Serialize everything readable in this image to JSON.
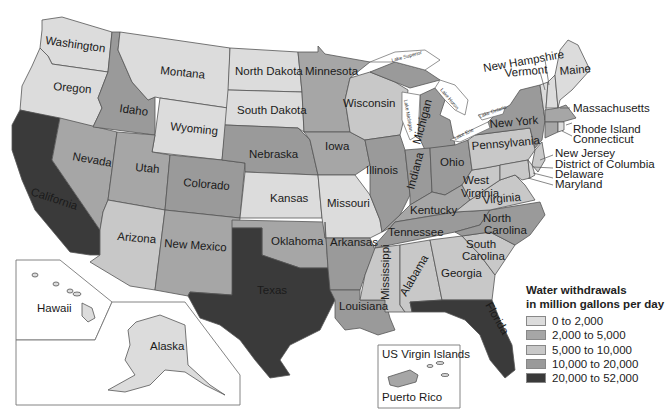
{
  "title": "Water withdrawals in million gallons per day",
  "legend": {
    "title_line1": "Water withdrawals",
    "title_line2": "in million gallons per day",
    "items": [
      {
        "label": "0 to 2,000",
        "color": "#dcdcdc"
      },
      {
        "label": "2,000 to 5,000",
        "color": "#a6a6a6"
      },
      {
        "label": "5,000 to 10,000",
        "color": "#c8c8c8"
      },
      {
        "label": "10,000 to 20,000",
        "color": "#9a9a9a"
      },
      {
        "label": "20,000 to 52,000",
        "color": "#3a3a3a"
      }
    ]
  },
  "states": {
    "washington": {
      "label": "Washington",
      "class": "0 to 2,000"
    },
    "oregon": {
      "label": "Oregon",
      "class": "0 to 2,000"
    },
    "california": {
      "label": "California",
      "class": "20,000 to 52,000"
    },
    "nevada": {
      "label": "Nevada",
      "class": "2,000 to 5,000"
    },
    "idaho": {
      "label": "Idaho",
      "class": "10,000 to 20,000"
    },
    "montana": {
      "label": "Montana",
      "class": "0 to 2,000"
    },
    "wyoming": {
      "label": "Wyoming",
      "class": "0 to 2,000"
    },
    "utah": {
      "label": "Utah",
      "class": "2,000 to 5,000"
    },
    "arizona": {
      "label": "Arizona",
      "class": "5,000 to 10,000"
    },
    "colorado": {
      "label": "Colorado",
      "class": "10,000 to 20,000"
    },
    "new_mexico": {
      "label": "New Mexico",
      "class": "2,000 to 5,000"
    },
    "north_dakota": {
      "label": "North Dakota",
      "class": "0 to 2,000"
    },
    "south_dakota": {
      "label": "South Dakota",
      "class": "0 to 2,000"
    },
    "nebraska": {
      "label": "Nebraska",
      "class": "10,000 to 20,000"
    },
    "kansas": {
      "label": "Kansas",
      "class": "0 to 2,000"
    },
    "oklahoma": {
      "label": "Oklahoma",
      "class": "2,000 to 5,000"
    },
    "texas": {
      "label": "Texas",
      "class": "20,000 to 52,000"
    },
    "minnesota": {
      "label": "Minnesota",
      "class": "2,000 to 5,000"
    },
    "iowa": {
      "label": "Iowa",
      "class": "2,000 to 5,000"
    },
    "missouri": {
      "label": "Missouri",
      "class": "5,000 to 10,000"
    },
    "arkansas": {
      "label": "Arkansas",
      "class": "10,000 to 20,000"
    },
    "louisiana": {
      "label": "Louisiana",
      "class": "10,000 to 20,000"
    },
    "wisconsin": {
      "label": "Wisconsin",
      "class": "5,000 to 10,000"
    },
    "illinois": {
      "label": "Illinois",
      "class": "10,000 to 20,000"
    },
    "michigan": {
      "label": "Michigan",
      "class": "10,000 to 20,000"
    },
    "indiana": {
      "label": "Indiana",
      "class": "10,000 to 20,000"
    },
    "ohio": {
      "label": "Ohio",
      "class": "10,000 to 20,000"
    },
    "kentucky": {
      "label": "Kentucky",
      "class": "2,000 to 5,000"
    },
    "tennessee": {
      "label": "Tennessee",
      "class": "10,000 to 20,000"
    },
    "mississippi": {
      "label": "Mississippi",
      "class": "5,000 to 10,000"
    },
    "alabama": {
      "label": "Alabama",
      "class": "5,000 to 10,000"
    },
    "georgia": {
      "label": "Georgia",
      "class": "5,000 to 10,000"
    },
    "florida": {
      "label": "Florida",
      "class": "20,000 to 52,000"
    },
    "south_carolina": {
      "label": "South Carolina",
      "class": "5,000 to 10,000"
    },
    "north_carolina": {
      "label": "North Carolina",
      "class": "10,000 to 20,000"
    },
    "virginia": {
      "label": "Virginia",
      "class": "5,000 to 10,000"
    },
    "west_virginia": {
      "label": "West Virginia",
      "class": "5,000 to 10,000"
    },
    "pennsylvania": {
      "label": "Pennsylvania",
      "class": "5,000 to 10,000"
    },
    "new_york": {
      "label": "New York",
      "class": "10,000 to 20,000"
    },
    "vermont": {
      "label": "Vermont",
      "class": "0 to 2,000"
    },
    "new_hampshire": {
      "label": "New Hampshire",
      "class": "0 to 2,000"
    },
    "maine": {
      "label": "Maine",
      "class": "0 to 2,000"
    },
    "massachusetts": {
      "label": "Massachusetts",
      "class": "2,000 to 5,000"
    },
    "rhode_island": {
      "label": "Rhode Island",
      "class": "0 to 2,000"
    },
    "connecticut": {
      "label": "Connecticut",
      "class": "2,000 to 5,000"
    },
    "new_jersey": {
      "label": "New Jersey",
      "class": "5,000 to 10,000"
    },
    "delaware": {
      "label": "Delaware",
      "class": "0 to 2,000"
    },
    "maryland": {
      "label": "Maryland",
      "class": "5,000 to 10,000"
    },
    "district_of_columbia": {
      "label": "District of Columbia",
      "class": "0 to 2,000"
    },
    "hawaii": {
      "label": "Hawaii",
      "class": "0 to 2,000"
    },
    "alaska": {
      "label": "Alaska",
      "class": "0 to 2,000"
    },
    "puerto_rico": {
      "label": "Puerto Rico",
      "class": "2,000 to 5,000"
    },
    "us_virgin_islands": {
      "label": "US Virgin Islands",
      "class": "0 to 2,000"
    }
  },
  "lakes": {
    "superior": "Lake Superior",
    "michigan": "Lake Michigan",
    "huron": "Lake Huron",
    "erie": "Lake Erie",
    "ontario": "Lake Ontario"
  }
}
